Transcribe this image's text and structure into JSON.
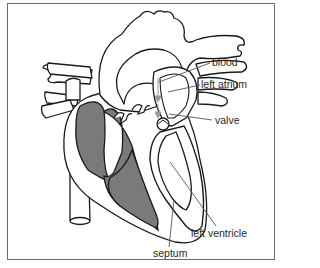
{
  "diagram": {
    "labels": {
      "blood": "blood",
      "left_atrium": "left atrium",
      "valve": "valve",
      "left_ventricle": "left ventricle",
      "septum": "septum"
    },
    "colors": {
      "outline": "#1a1a1a",
      "chamber_fill": "#7a7a7a",
      "wall_fill": "#ffffff",
      "leader_line": "#555555",
      "frame": "#6a6a6a",
      "arrow": "#9a9a9a"
    }
  }
}
